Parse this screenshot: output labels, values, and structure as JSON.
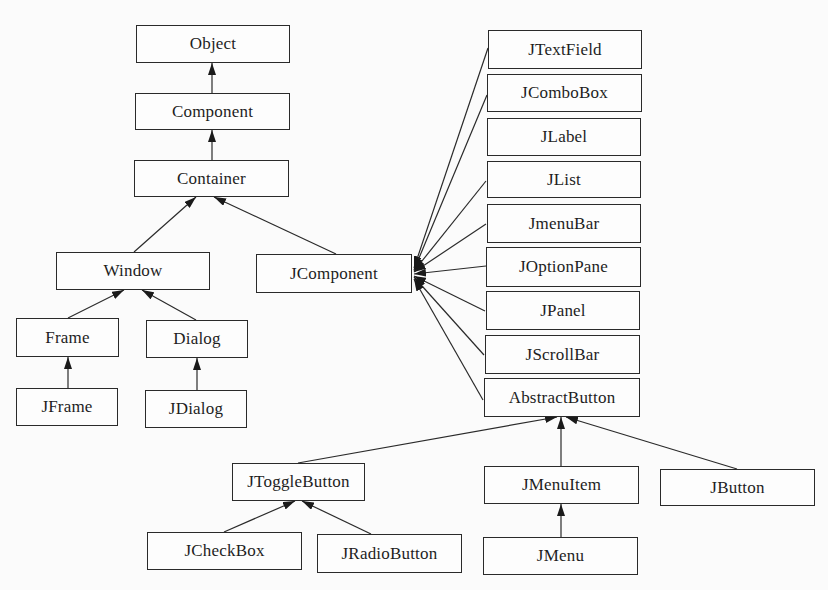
{
  "diagram": {
    "type": "class-hierarchy",
    "edge_style": "solid line with filled arrowhead pointing to parent",
    "line_color": "#2a2a2a",
    "nodes": [
      {
        "id": "Object",
        "label": "Object",
        "x": 136,
        "y": 25,
        "w": 154,
        "h": 38
      },
      {
        "id": "Component",
        "label": "Component",
        "x": 135,
        "y": 93,
        "w": 155,
        "h": 37
      },
      {
        "id": "Container",
        "label": "Container",
        "x": 134,
        "y": 160,
        "w": 155,
        "h": 37
      },
      {
        "id": "Window",
        "label": "Window",
        "x": 56,
        "y": 252,
        "w": 154,
        "h": 38
      },
      {
        "id": "JComponent",
        "label": "JComponent",
        "x": 256,
        "y": 254,
        "w": 156,
        "h": 39
      },
      {
        "id": "Frame",
        "label": "Frame",
        "x": 16,
        "y": 318,
        "w": 103,
        "h": 39
      },
      {
        "id": "Dialog",
        "label": "Dialog",
        "x": 146,
        "y": 320,
        "w": 102,
        "h": 38
      },
      {
        "id": "JFrame",
        "label": "JFrame",
        "x": 16,
        "y": 388,
        "w": 102,
        "h": 38
      },
      {
        "id": "JDialog",
        "label": "JDialog",
        "x": 145,
        "y": 390,
        "w": 102,
        "h": 38
      },
      {
        "id": "JTextField",
        "label": "JTextField",
        "x": 488,
        "y": 30,
        "w": 154,
        "h": 39
      },
      {
        "id": "JComboBox",
        "label": "JComboBox",
        "x": 487,
        "y": 74,
        "w": 155,
        "h": 38
      },
      {
        "id": "JLabel",
        "label": "JLabel",
        "x": 487,
        "y": 118,
        "w": 154,
        "h": 38
      },
      {
        "id": "JList",
        "label": "JList",
        "x": 487,
        "y": 161,
        "w": 154,
        "h": 37
      },
      {
        "id": "JmenuBar",
        "label": "JmenuBar",
        "x": 487,
        "y": 204,
        "w": 154,
        "h": 39
      },
      {
        "id": "JOptionPane",
        "label": "JOptionPane",
        "x": 486,
        "y": 247,
        "w": 155,
        "h": 40
      },
      {
        "id": "JPanel",
        "label": "JPanel",
        "x": 486,
        "y": 291,
        "w": 154,
        "h": 39
      },
      {
        "id": "JScrollBar",
        "label": "JScrollBar",
        "x": 485,
        "y": 335,
        "w": 155,
        "h": 39
      },
      {
        "id": "AbstractButton",
        "label": "AbstractButton",
        "x": 484,
        "y": 378,
        "w": 156,
        "h": 39
      },
      {
        "id": "JToggleButton",
        "label": "JToggleButton",
        "x": 232,
        "y": 463,
        "w": 133,
        "h": 38
      },
      {
        "id": "JMenuItem",
        "label": "JMenuItem",
        "x": 484,
        "y": 466,
        "w": 155,
        "h": 38
      },
      {
        "id": "JButton",
        "label": "JButton",
        "x": 660,
        "y": 469,
        "w": 155,
        "h": 37
      },
      {
        "id": "JCheckBox",
        "label": "JCheckBox",
        "x": 147,
        "y": 532,
        "w": 155,
        "h": 38
      },
      {
        "id": "JRadioButton",
        "label": "JRadioButton",
        "x": 317,
        "y": 534,
        "w": 145,
        "h": 39
      },
      {
        "id": "JMenu",
        "label": "JMenu",
        "x": 483,
        "y": 537,
        "w": 155,
        "h": 38
      }
    ],
    "edges": [
      {
        "from": "Component",
        "to": "Object",
        "x1": 212,
        "y1": 93,
        "x2": 212,
        "y2": 63
      },
      {
        "from": "Container",
        "to": "Component",
        "x1": 212,
        "y1": 160,
        "x2": 212,
        "y2": 130
      },
      {
        "from": "Window",
        "to": "Container",
        "x1": 134,
        "y1": 252,
        "x2": 196,
        "y2": 197
      },
      {
        "from": "JComponent",
        "to": "Container",
        "x1": 336,
        "y1": 254,
        "x2": 214,
        "y2": 197
      },
      {
        "from": "Frame",
        "to": "Window",
        "x1": 68,
        "y1": 318,
        "x2": 124,
        "y2": 290
      },
      {
        "from": "Dialog",
        "to": "Window",
        "x1": 196,
        "y1": 320,
        "x2": 142,
        "y2": 290
      },
      {
        "from": "JFrame",
        "to": "Frame",
        "x1": 68,
        "y1": 388,
        "x2": 68,
        "y2": 357
      },
      {
        "from": "JDialog",
        "to": "Dialog",
        "x1": 197,
        "y1": 390,
        "x2": 197,
        "y2": 358
      },
      {
        "from": "JTextField",
        "to": "JComponent",
        "x1": 488,
        "y1": 48,
        "x2": 414,
        "y2": 268
      },
      {
        "from": "JComboBox",
        "to": "JComponent",
        "x1": 487,
        "y1": 95,
        "x2": 414,
        "y2": 270
      },
      {
        "from": "JList",
        "to": "JComponent",
        "x1": 486,
        "y1": 181,
        "x2": 414,
        "y2": 271
      },
      {
        "from": "JmenuBar",
        "to": "JComponent",
        "x1": 486,
        "y1": 224,
        "x2": 414,
        "y2": 272
      },
      {
        "from": "JOptionPane",
        "to": "JComponent",
        "x1": 486,
        "y1": 266,
        "x2": 414,
        "y2": 274
      },
      {
        "from": "JPanel",
        "to": "JComponent",
        "x1": 485,
        "y1": 311,
        "x2": 414,
        "y2": 276
      },
      {
        "from": "JScrollBar",
        "to": "JComponent",
        "x1": 484,
        "y1": 355,
        "x2": 414,
        "y2": 277
      },
      {
        "from": "AbstractButton",
        "to": "JComponent",
        "x1": 483,
        "y1": 400,
        "x2": 414,
        "y2": 279
      },
      {
        "from": "JToggleButton",
        "to": "AbstractButton",
        "x1": 298,
        "y1": 463,
        "x2": 557,
        "y2": 417
      },
      {
        "from": "JMenuItem",
        "to": "AbstractButton",
        "x1": 561,
        "y1": 466,
        "x2": 561,
        "y2": 417
      },
      {
        "from": "JButton",
        "to": "AbstractButton",
        "x1": 737,
        "y1": 469,
        "x2": 566,
        "y2": 417
      },
      {
        "from": "JCheckBox",
        "to": "JToggleButton",
        "x1": 224,
        "y1": 532,
        "x2": 295,
        "y2": 501
      },
      {
        "from": "JRadioButton",
        "to": "JToggleButton",
        "x1": 371,
        "y1": 534,
        "x2": 302,
        "y2": 501
      },
      {
        "from": "JMenu",
        "to": "JMenuItem",
        "x1": 561,
        "y1": 537,
        "x2": 561,
        "y2": 504
      }
    ]
  }
}
